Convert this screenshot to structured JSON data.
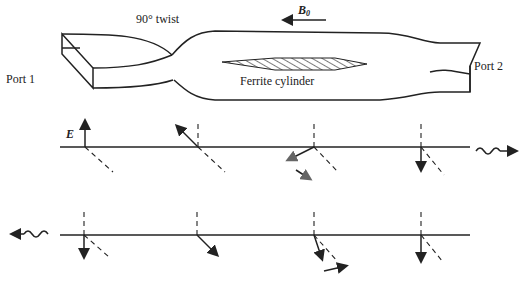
{
  "diagram": {
    "labels": {
      "twist": "90° twist",
      "b0": "B",
      "b0_sub": "0",
      "port1": "Port 1",
      "port2": "Port 2",
      "ferrite": "Ferrite cylinder",
      "e_field": "E"
    },
    "rows": [
      {
        "name": "forward-propagation",
        "direction": "right",
        "field_angles_deg": [
          90,
          135,
          200,
          270
        ]
      },
      {
        "name": "backward-propagation",
        "direction": "left",
        "field_angles_deg": [
          270,
          315,
          290,
          270
        ]
      }
    ],
    "colors": {
      "ink": "#222222",
      "background": "#ffffff"
    }
  }
}
